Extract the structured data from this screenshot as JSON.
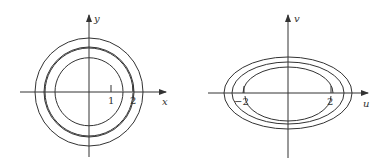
{
  "figures": [
    {
      "name": "xy-plane",
      "x_axis_label": "x",
      "y_axis_label": "y",
      "tick_labels": [
        "1",
        "2"
      ],
      "curves": "three concentric circles; innermost circle has a gap near x=2"
    },
    {
      "name": "uv-plane",
      "x_axis_label": "u",
      "y_axis_label": "v",
      "tick_labels": [
        "−2",
        "2"
      ],
      "curves": "three concentric ellipses; innermost ellipse has gaps near u=-2 and u=2"
    }
  ],
  "colors": {
    "ink": "#333333",
    "background": "#ffffff"
  }
}
